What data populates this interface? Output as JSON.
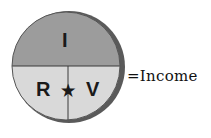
{
  "diagram": {
    "top_label": "I",
    "bottom_left_label": "R",
    "operator": "★",
    "bottom_right_label": "V",
    "equation_text": "=Income",
    "colors": {
      "top_fill": "#9c9c9c",
      "bottom_fill": "#d9d9d9",
      "edge_shadow": "#5a5a5a",
      "divider": "#3a3a3a"
    }
  }
}
